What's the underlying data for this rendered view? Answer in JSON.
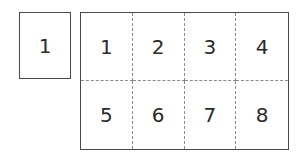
{
  "single_page": {
    "label": "1"
  },
  "sheet": {
    "columns": 4,
    "rows": 2,
    "cells": [
      "1",
      "2",
      "3",
      "4",
      "5",
      "6",
      "7",
      "8"
    ]
  },
  "colors": {
    "border": "#4a4a4a",
    "divider": "#8a8a8a",
    "text": "#2a2a2a",
    "background": "#ffffff"
  }
}
